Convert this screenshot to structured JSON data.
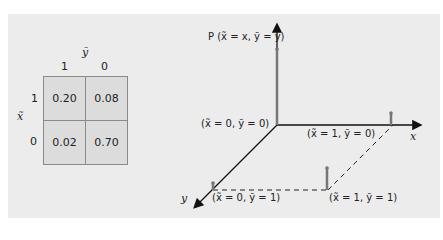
{
  "table": {
    "col_var": "ỹ",
    "row_var": "x̃",
    "col_headers": [
      "1",
      "0"
    ],
    "row_headers": [
      "1",
      "0"
    ],
    "cells": [
      [
        "0.20",
        "0.08"
      ],
      [
        "0.02",
        "0.70"
      ]
    ]
  },
  "diagram": {
    "p_axis_label": "P (x̃ = x, ỹ = y)",
    "x_axis_label": "x",
    "y_axis_label": "y",
    "points": [
      {
        "label": "(x̃ = 0, ỹ = 0)",
        "prob": 0.7
      },
      {
        "label": "(x̃ = 1, ỹ = 0)",
        "prob": 0.08
      },
      {
        "label": "(x̃ = 0, ỹ = 1)",
        "prob": 0.02
      },
      {
        "label": "(x̃ = 1, ỹ = 1)",
        "prob": 0.2
      }
    ],
    "colors": {
      "axis": "#111111",
      "stem": "#777777",
      "panel": "#ececec",
      "cell": "#dcdcdc"
    }
  }
}
